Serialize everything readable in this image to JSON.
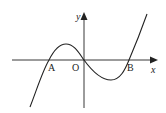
{
  "diagram": {
    "type": "cubic-function-graph",
    "colors": {
      "stroke": "#222222",
      "background": "#ffffff"
    },
    "axes": {
      "x_label": "x",
      "y_label": "y"
    },
    "points": [
      {
        "name": "A",
        "label": "A",
        "description": "left x-intercept"
      },
      {
        "name": "O",
        "label": "O",
        "description": "origin"
      },
      {
        "name": "B",
        "label": "B",
        "description": "right x-intercept"
      }
    ],
    "curve": {
      "description": "cubic curve through A, O and B with local maximum between A and O and local minimum between O and B"
    }
  }
}
